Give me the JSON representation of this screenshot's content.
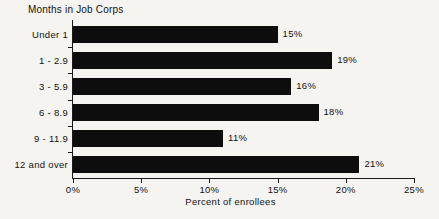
{
  "chart_data": {
    "type": "bar",
    "orientation": "horizontal",
    "title": "Months in Job Corps",
    "xlabel": "Percent of enrollees",
    "ylabel": "Months in Job Corps",
    "categories": [
      "Under 1",
      "1 - 2.9",
      "3 - 5.9",
      "6 - 8.9",
      "9 - 11.9",
      "12 and over"
    ],
    "values": [
      15,
      19,
      16,
      18,
      11,
      21
    ],
    "value_labels": [
      "15%",
      "19%",
      "16%",
      "18%",
      "11%",
      "21%"
    ],
    "xlim": [
      0,
      25
    ],
    "xticks": [
      0,
      5,
      10,
      15,
      20,
      25
    ],
    "xtick_labels": [
      "0%",
      "5%",
      "10%",
      "15%",
      "20%",
      "25%"
    ],
    "grid": false,
    "legend": null,
    "bar_color": "#0d0d0d",
    "background_color": "#f5f4f1",
    "axis_color": "#1a1a1a"
  }
}
